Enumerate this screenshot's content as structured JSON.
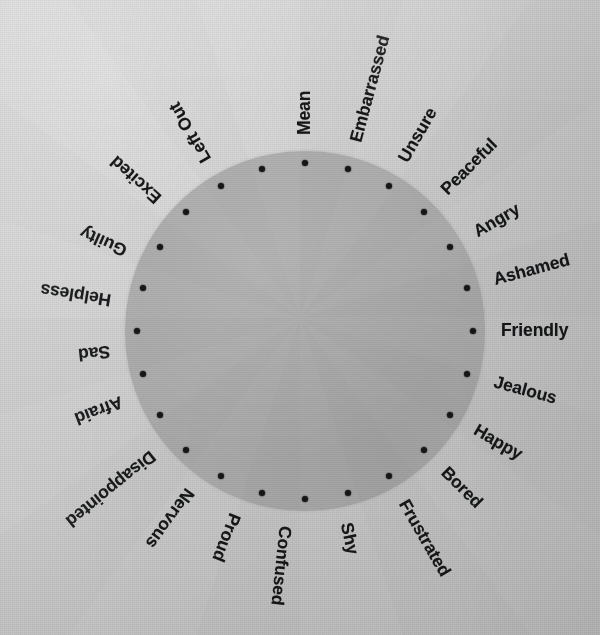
{
  "figure": {
    "name": "feelings-wheel",
    "background_color": "#cbcbcb",
    "disc_color": "#a9a9a9",
    "ink_color": "#141618",
    "center_x": 305,
    "center_y": 331,
    "disc_radius": 180,
    "tick_radius": 168,
    "label_radius": 196
  },
  "chart_data": {
    "type": "pie",
    "title": "",
    "subtitle": "",
    "xlabel": "",
    "ylabel": "",
    "legend_position": "around-circle",
    "grid": false,
    "slice_count": 24,
    "slice_degrees": 15,
    "start_angle_deg": 0,
    "values": [
      1,
      1,
      1,
      1,
      1,
      1,
      1,
      1,
      1,
      1,
      1,
      1,
      1,
      1,
      1,
      1,
      1,
      1,
      1,
      1,
      1,
      1,
      1,
      1
    ],
    "categories": [
      "Mean",
      "Embarrassed",
      "Unsure",
      "Peaceful",
      "Angry",
      "Ashamed",
      "Friendly",
      "Jealous",
      "Happy",
      "Bored",
      "Frustrated",
      "Shy",
      "Confused",
      "Proud",
      "Nervous",
      "Disappointed",
      "Afraid",
      "Sad",
      "Helpless",
      "Guilty",
      "Excited",
      "Left Out",
      "Mean",
      "Mean"
    ],
    "labels": [
      {
        "text": "Mean",
        "angle_deg": 0
      },
      {
        "text": "Embarrassed",
        "angle_deg": 15
      },
      {
        "text": "Unsure",
        "angle_deg": 30
      },
      {
        "text": "Peaceful",
        "angle_deg": 45
      },
      {
        "text": "Angry",
        "angle_deg": 60
      },
      {
        "text": "Ashamed",
        "angle_deg": 75
      },
      {
        "text": "Friendly",
        "angle_deg": 90
      },
      {
        "text": "Jealous",
        "angle_deg": 105
      },
      {
        "text": "Happy",
        "angle_deg": 120
      },
      {
        "text": "Bored",
        "angle_deg": 135
      },
      {
        "text": "Frustrated",
        "angle_deg": 150
      },
      {
        "text": "Shy",
        "angle_deg": 168
      },
      {
        "text": "Confused",
        "angle_deg": 186
      },
      {
        "text": "Proud",
        "angle_deg": 201
      },
      {
        "text": "Nervous",
        "angle_deg": 216
      },
      {
        "text": "Disappointed",
        "angle_deg": 231
      },
      {
        "text": "Afraid",
        "angle_deg": 249
      },
      {
        "text": "Sad",
        "angle_deg": 264
      },
      {
        "text": "Helpless",
        "angle_deg": 279
      },
      {
        "text": "Guilty",
        "angle_deg": 294
      },
      {
        "text": "Excited",
        "angle_deg": 312
      },
      {
        "text": "Left Out",
        "angle_deg": 330
      },
      {
        "text": "",
        "angle_deg": 345
      },
      {
        "text": "",
        "angle_deg": 357
      }
    ],
    "tick_angles_deg": [
      0,
      15,
      30,
      45,
      60,
      75,
      90,
      105,
      120,
      135,
      150,
      165,
      180,
      195,
      210,
      225,
      240,
      255,
      270,
      285,
      300,
      315,
      330,
      345
    ]
  }
}
